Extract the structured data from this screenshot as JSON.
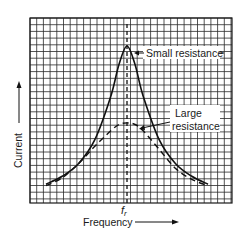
{
  "chart_data": {
    "type": "line",
    "title": "",
    "xlabel": "Frequency",
    "ylabel": "Current",
    "x_tick_labels": [
      "f_r"
    ],
    "resonant_frequency_label": "f",
    "resonant_frequency_subscript": "r",
    "grid": true,
    "legend": "inline annotations",
    "annotations": [
      {
        "text": "Small resistance",
        "points_to": "solid curve peak"
      },
      {
        "text": "Large resistance",
        "points_to": "dashed curve near peak"
      }
    ],
    "x": [
      -1.0,
      -0.8,
      -0.6,
      -0.4,
      -0.2,
      -0.1,
      0.0,
      0.1,
      0.2,
      0.4,
      0.6,
      0.8,
      1.0
    ],
    "series": [
      {
        "name": "Small resistance",
        "style": "solid",
        "values": [
          0.12,
          0.17,
          0.25,
          0.4,
          0.68,
          0.88,
          1.0,
          0.88,
          0.68,
          0.4,
          0.25,
          0.17,
          0.12
        ]
      },
      {
        "name": "Large resistance",
        "style": "dashed",
        "values": [
          0.11,
          0.16,
          0.25,
          0.36,
          0.46,
          0.5,
          0.51,
          0.5,
          0.46,
          0.34,
          0.22,
          0.15,
          0.11
        ]
      }
    ],
    "ylim": [
      0,
      1.15
    ],
    "xlim": [
      -1.15,
      1.15
    ]
  },
  "labels": {
    "small_resistance": "Small resistance",
    "large_resistance_line1": "Large",
    "large_resistance_line2": "resistance",
    "y_axis": "Current",
    "x_axis": "Frequency",
    "fr_main": "f",
    "fr_sub": "r"
  }
}
